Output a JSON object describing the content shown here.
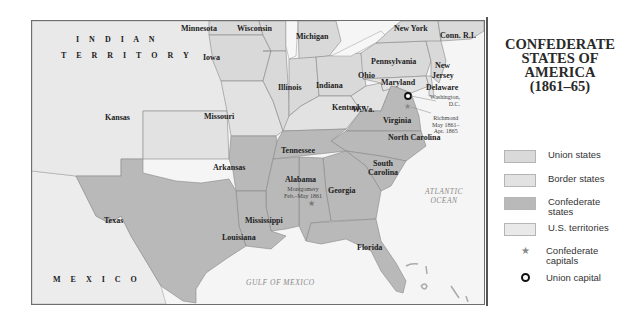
{
  "title": {
    "line1": "CONFEDERATE",
    "line2": "STATES OF",
    "line3": "AMERICA",
    "line4": "(1861–65)"
  },
  "colors": {
    "union": "#d9d9d9",
    "border": "#e2e2e2",
    "confederate": "#b9b9b9",
    "territory": "#e9e9e9",
    "water": "#f7f7f7",
    "foreign": "#ececec"
  },
  "legend": {
    "items": [
      {
        "label": "Union states",
        "type": "swatch",
        "color": "#d9d9d9"
      },
      {
        "label": "Border states",
        "type": "swatch",
        "color": "#e2e2e2"
      },
      {
        "label_line1": "Confederate",
        "label_line2": "states",
        "type": "swatch",
        "color": "#b9b9b9"
      },
      {
        "label": "U.S. territories",
        "type": "swatch",
        "color": "#e9e9e9"
      },
      {
        "label_line1": "Confederate",
        "label_line2": "capitals",
        "type": "symbol",
        "icon": "star-icon",
        "glyph": "★"
      },
      {
        "label": "Union capital",
        "type": "symbol",
        "icon": "ring-icon"
      }
    ]
  },
  "map": {
    "regions": {
      "indian_territory_line1": "I N D I A N",
      "indian_territory_line2": "T E R R I T O R Y",
      "mexico": "M E X I C O",
      "gulf": "GULF OF MEXICO",
      "atlantic_line1": "ATLANTIC",
      "atlantic_line2": "OCEAN"
    },
    "states": {
      "minnesota": "Minnesota",
      "wisconsin": "Wisconsin",
      "michigan": "Michigan",
      "new_york": "New York",
      "conn": "Conn.",
      "ri": "R.I.",
      "iowa": "Iowa",
      "pennsylvania": "Pennsylvania",
      "new_jersey_line1": "New",
      "new_jersey_line2": "Jersey",
      "illinois": "Illinois",
      "indiana": "Indiana",
      "ohio": "Ohio",
      "maryland": "Maryland",
      "delaware": "Delaware",
      "kansas": "Kansas",
      "missouri": "Missouri",
      "kentucky": "Kentucky",
      "west_virginia": "W. Va.",
      "virginia": "Virginia",
      "north_carolina": "North Carolina",
      "tennessee": "Tennessee",
      "arkansas": "Arkansas",
      "south_carolina_line1": "South",
      "south_carolina_line2": "Carolina",
      "alabama": "Alabama",
      "georgia": "Georgia",
      "mississippi": "Mississippi",
      "texas": "Texas",
      "louisiana": "Louisiana",
      "florida": "Florida"
    },
    "capitals": {
      "washington_line1": "Washington,",
      "washington_line2": "D.C.",
      "richmond_line1": "Richmond",
      "richmond_line2": "May 1861–",
      "richmond_line3": "Apr. 1865",
      "montgomery_line1": "Montgomery",
      "montgomery_line2": "Feb.–May 1861"
    }
  }
}
